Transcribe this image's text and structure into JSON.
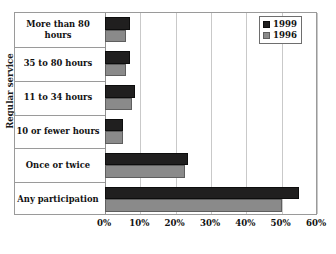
{
  "chart_data": {
    "type": "bar",
    "orientation": "horizontal",
    "title": "",
    "xlabel": "",
    "ylabel": "Regular service",
    "xlim": [
      0,
      60
    ],
    "xticks": [
      0,
      10,
      20,
      30,
      40,
      50,
      60
    ],
    "xtick_labels": [
      "0%",
      "10%",
      "20%",
      "30%",
      "40%",
      "50%",
      "60%"
    ],
    "grid": true,
    "legend_position": "top-right",
    "categories": [
      "More than 80 hours",
      "35 to 80 hours",
      "11 to 34 hours",
      "10 or fewer hours",
      "Once or twice",
      "Any participation"
    ],
    "series": [
      {
        "name": "1999",
        "color": "#201f1f",
        "values": [
          7,
          7,
          8.5,
          5,
          23.5,
          55
        ]
      },
      {
        "name": "1996",
        "color": "#8a8a8a",
        "values": [
          6,
          6,
          7.5,
          5,
          22.5,
          50
        ]
      }
    ]
  },
  "legend": {
    "entries": [
      {
        "label": "1999"
      },
      {
        "label": "1996"
      }
    ]
  },
  "axis": {
    "y_title": "Regular service"
  },
  "colors": {
    "series_1999": "#201f1f",
    "series_1996": "#8a8a8a",
    "gridline": "#c9c9c9",
    "frame": "#9a9a9a",
    "background": "#ffffff"
  }
}
